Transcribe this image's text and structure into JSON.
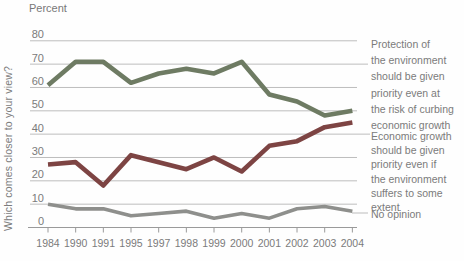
{
  "chart_data": {
    "type": "line",
    "unit_label": "Percent",
    "y_axis_question": "Which comes closer to your view?",
    "categories": [
      "1984",
      "1990",
      "1991",
      "1995",
      "1997",
      "1998",
      "1999",
      "2000",
      "2001",
      "2002",
      "2003",
      "2004"
    ],
    "series": [
      {
        "name": "Protection of the environment should be given priority even at the risk of curbing economic growth",
        "label": "Protection of\nthe environment\nshould be given\npriority even at\nthe risk of curbing\neconomic growth",
        "color": "#6e7b63",
        "values": [
          61,
          71,
          71,
          62,
          66,
          68,
          66,
          71,
          57,
          54,
          48,
          50
        ]
      },
      {
        "name": "Economic growth should be given priority even if the environment suffers to some extent",
        "label": "Economic growth\nshould be given\npriority even if\nthe environment\nsuffers to some\nextent",
        "color": "#7d4443",
        "values": [
          27,
          28,
          18,
          31,
          28,
          25,
          30,
          24,
          35,
          37,
          43,
          45
        ]
      },
      {
        "name": "No opinion",
        "label": "No opinion",
        "color": "#8e8f8c",
        "values": [
          10,
          8,
          8,
          5,
          6,
          7,
          4,
          6,
          4,
          8,
          9,
          7
        ]
      }
    ],
    "ylim": [
      0,
      80
    ],
    "ytick_step": 10,
    "grid": true,
    "legend_position": "right-annotations",
    "colors": {
      "grid_line": "#b5b5b5",
      "axis_line": "#9a9a9a",
      "tick_text": "#7b7b7b"
    }
  }
}
